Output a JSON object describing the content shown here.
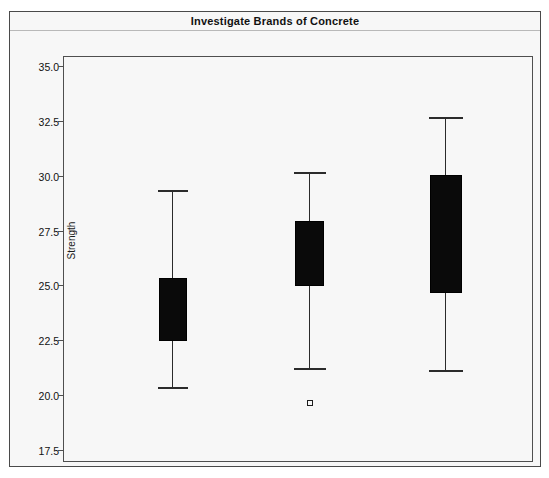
{
  "window": {
    "title": "Investigate Brands of Concrete"
  },
  "chart_data": {
    "type": "box",
    "title": "Investigate Brands of Concrete",
    "xlabel": "",
    "ylabel": "Strength",
    "ylim": [
      17.5,
      35.0
    ],
    "yticks": [
      "35.0",
      "32.5",
      "30.0",
      "27.5",
      "25.0",
      "22.5",
      "20.0",
      "17.5"
    ],
    "ytick_values": [
      35.0,
      32.5,
      30.0,
      27.5,
      25.0,
      22.5,
      20.0,
      17.5
    ],
    "grid": false,
    "legend": "none",
    "categories": [
      "1",
      "2",
      "3"
    ],
    "boxes": [
      {
        "name": "brand-1",
        "whisker_low": 20.4,
        "q1": 22.5,
        "median": 23.9,
        "q3": 25.4,
        "whisker_high": 29.4,
        "outliers": []
      },
      {
        "name": "brand-2",
        "whisker_low": 21.3,
        "q1": 25.0,
        "median": 26.5,
        "q3": 28.0,
        "whisker_high": 30.2,
        "outliers": [
          19.7
        ]
      },
      {
        "name": "brand-3",
        "whisker_low": 21.2,
        "q1": 24.7,
        "median": 27.4,
        "q3": 30.1,
        "whisker_high": 32.7,
        "outliers": []
      }
    ]
  },
  "colors": {
    "box_fill": "#0a0a0a",
    "line": "#2b2b2b",
    "background": "#f7f7f7",
    "frame": "#4f4f4f"
  }
}
